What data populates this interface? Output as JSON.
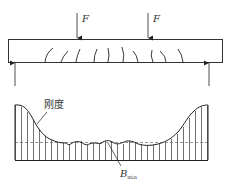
{
  "diagram": {
    "title": "",
    "beam": {
      "load_labels": [
        "F",
        "F"
      ],
      "crack_count": 10
    },
    "stiffness_plot": {
      "curve_label": "刚度",
      "min_label_main": "B",
      "min_label_sub": "min",
      "hatch_count": 33
    },
    "colors": {
      "line": "#333333",
      "dashed": "#555555",
      "background": "#ffffff"
    }
  }
}
